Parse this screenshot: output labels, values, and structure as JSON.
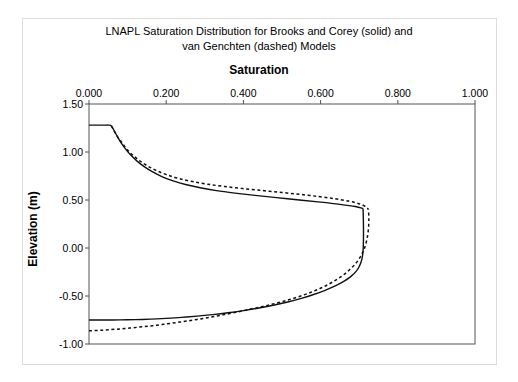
{
  "figure": {
    "title_line_1": "LNAPL Saturation Distribution for Brooks and Corey (solid) and",
    "title_line_2": "van Genchten (dashed) Models",
    "x_axis_title": "Saturation",
    "y_axis_title": "Elevation (m)",
    "border_color": "#dcdcdc",
    "axis_color": "#555555",
    "curve_color": "#111111"
  },
  "chart_data": {
    "type": "line",
    "title": "LNAPL Saturation Distribution for Brooks and Corey (solid) and van Genchten (dashed) Models",
    "xlabel": "Saturation",
    "ylabel": "Elevation (m)",
    "xlim": [
      0.0,
      1.0
    ],
    "ylim": [
      -1.0,
      1.5
    ],
    "xticks": [
      0.0,
      0.2,
      0.4,
      0.6,
      0.8,
      1.0
    ],
    "xtick_labels": [
      "0.000",
      "0.200",
      "0.400",
      "0.600",
      "0.800",
      "1.000"
    ],
    "yticks": [
      1.5,
      1.0,
      0.5,
      0.0,
      -0.5,
      -1.0
    ],
    "ytick_labels": [
      "1.50",
      "1.00",
      "0.50",
      "0.00",
      "-0.50",
      "-1.00"
    ],
    "grid": false,
    "legend": "none",
    "x_axis_position": "top",
    "series": [
      {
        "name": "Brooks and Corey (solid)",
        "style": "solid",
        "branch": "upper",
        "points": [
          [
            0.0,
            1.28
          ],
          [
            0.02,
            1.28
          ],
          [
            0.04,
            1.28
          ],
          [
            0.05,
            1.28
          ],
          [
            0.058,
            1.272
          ],
          [
            0.066,
            1.215
          ],
          [
            0.075,
            1.15
          ],
          [
            0.085,
            1.085
          ],
          [
            0.097,
            1.02
          ],
          [
            0.11,
            0.96
          ],
          [
            0.126,
            0.9
          ],
          [
            0.144,
            0.845
          ],
          [
            0.165,
            0.792
          ],
          [
            0.19,
            0.742
          ],
          [
            0.218,
            0.7
          ],
          [
            0.25,
            0.662
          ],
          [
            0.288,
            0.628
          ],
          [
            0.33,
            0.598
          ],
          [
            0.378,
            0.572
          ],
          [
            0.43,
            0.548
          ],
          [
            0.486,
            0.525
          ],
          [
            0.545,
            0.5
          ],
          [
            0.6,
            0.478
          ],
          [
            0.65,
            0.455
          ],
          [
            0.69,
            0.432
          ],
          [
            0.71,
            0.412
          ]
        ]
      },
      {
        "name": "Brooks and Corey (solid)",
        "style": "solid",
        "branch": "lower",
        "points": [
          [
            0.0,
            -0.75
          ],
          [
            0.04,
            -0.75
          ],
          [
            0.08,
            -0.749
          ],
          [
            0.12,
            -0.746
          ],
          [
            0.16,
            -0.741
          ],
          [
            0.2,
            -0.733
          ],
          [
            0.24,
            -0.723
          ],
          [
            0.28,
            -0.71
          ],
          [
            0.32,
            -0.694
          ],
          [
            0.36,
            -0.675
          ],
          [
            0.4,
            -0.652
          ],
          [
            0.44,
            -0.625
          ],
          [
            0.48,
            -0.594
          ],
          [
            0.515,
            -0.562
          ],
          [
            0.55,
            -0.524
          ],
          [
            0.58,
            -0.487
          ],
          [
            0.61,
            -0.443
          ],
          [
            0.638,
            -0.395
          ],
          [
            0.66,
            -0.348
          ],
          [
            0.678,
            -0.298
          ],
          [
            0.692,
            -0.244
          ],
          [
            0.701,
            -0.185
          ],
          [
            0.707,
            -0.115
          ],
          [
            0.71,
            -0.03
          ],
          [
            0.711,
            0.09
          ],
          [
            0.711,
            0.24
          ],
          [
            0.71,
            0.412
          ]
        ]
      },
      {
        "name": "van Genuchten (dashed)",
        "style": "dashed",
        "branch": "upper",
        "points": [
          [
            0.058,
            1.272
          ],
          [
            0.066,
            1.214
          ],
          [
            0.076,
            1.148
          ],
          [
            0.088,
            1.082
          ],
          [
            0.1,
            1.02
          ],
          [
            0.115,
            0.962
          ],
          [
            0.132,
            0.906
          ],
          [
            0.152,
            0.854
          ],
          [
            0.175,
            0.806
          ],
          [
            0.202,
            0.762
          ],
          [
            0.233,
            0.724
          ],
          [
            0.268,
            0.692
          ],
          [
            0.308,
            0.664
          ],
          [
            0.352,
            0.64
          ],
          [
            0.4,
            0.618
          ],
          [
            0.45,
            0.598
          ],
          [
            0.5,
            0.578
          ],
          [
            0.548,
            0.558
          ],
          [
            0.595,
            0.536
          ],
          [
            0.638,
            0.512
          ],
          [
            0.675,
            0.486
          ],
          [
            0.702,
            0.458
          ],
          [
            0.718,
            0.428
          ],
          [
            0.724,
            0.4
          ]
        ]
      },
      {
        "name": "van Genuchten (dashed)",
        "style": "dashed",
        "branch": "lower",
        "points": [
          [
            0.0,
            -0.862
          ],
          [
            0.035,
            -0.856
          ],
          [
            0.07,
            -0.846
          ],
          [
            0.105,
            -0.834
          ],
          [
            0.14,
            -0.82
          ],
          [
            0.175,
            -0.804
          ],
          [
            0.21,
            -0.786
          ],
          [
            0.245,
            -0.766
          ],
          [
            0.28,
            -0.744
          ],
          [
            0.315,
            -0.72
          ],
          [
            0.35,
            -0.694
          ],
          [
            0.385,
            -0.666
          ],
          [
            0.42,
            -0.636
          ],
          [
            0.455,
            -0.604
          ],
          [
            0.49,
            -0.57
          ],
          [
            0.522,
            -0.534
          ],
          [
            0.553,
            -0.494
          ],
          [
            0.582,
            -0.45
          ],
          [
            0.608,
            -0.404
          ],
          [
            0.632,
            -0.352
          ],
          [
            0.654,
            -0.296
          ],
          [
            0.673,
            -0.234
          ],
          [
            0.69,
            -0.166
          ],
          [
            0.703,
            -0.092
          ],
          [
            0.713,
            -0.01
          ],
          [
            0.72,
            0.09
          ],
          [
            0.724,
            0.2
          ],
          [
            0.725,
            0.31
          ],
          [
            0.724,
            0.4
          ]
        ]
      }
    ]
  }
}
